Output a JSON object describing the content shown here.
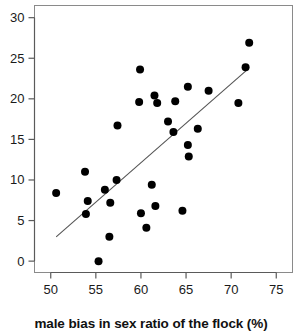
{
  "chart_data": {
    "type": "scatter",
    "title": "",
    "xlabel": "male bias in sex ratio of the flock (%)",
    "ylabel": "",
    "xlim": [
      48.2,
      76.8
    ],
    "ylim": [
      -1.4,
      31.5
    ],
    "xticks": [
      50,
      55,
      60,
      65,
      70,
      75
    ],
    "yticks": [
      0,
      5,
      10,
      15,
      20,
      25,
      30
    ],
    "xtick_labels": [
      "50",
      "55",
      "60",
      "65",
      "70",
      "75"
    ],
    "ytick_labels": [
      "0",
      "5",
      "10",
      "15",
      "20",
      "25",
      "30"
    ],
    "grid": false,
    "legend": null,
    "marker": "filled-circle",
    "marker_color": "#000000",
    "marker_size": 5.6,
    "points": [
      {
        "x": 50.6,
        "y": 8.4
      },
      {
        "x": 53.8,
        "y": 11.0
      },
      {
        "x": 53.9,
        "y": 5.8
      },
      {
        "x": 54.1,
        "y": 7.4
      },
      {
        "x": 55.3,
        "y": 0.0
      },
      {
        "x": 56.0,
        "y": 8.8
      },
      {
        "x": 56.5,
        "y": 3.0
      },
      {
        "x": 56.6,
        "y": 7.2
      },
      {
        "x": 57.3,
        "y": 10.0
      },
      {
        "x": 57.4,
        "y": 16.7
      },
      {
        "x": 59.8,
        "y": 19.6
      },
      {
        "x": 59.9,
        "y": 23.6
      },
      {
        "x": 60.0,
        "y": 5.9
      },
      {
        "x": 60.6,
        "y": 4.1
      },
      {
        "x": 61.2,
        "y": 9.4
      },
      {
        "x": 61.5,
        "y": 20.4
      },
      {
        "x": 61.6,
        "y": 6.8
      },
      {
        "x": 61.8,
        "y": 19.5
      },
      {
        "x": 63.0,
        "y": 17.2
      },
      {
        "x": 63.6,
        "y": 15.9
      },
      {
        "x": 63.8,
        "y": 19.7
      },
      {
        "x": 64.6,
        "y": 6.2
      },
      {
        "x": 65.2,
        "y": 21.5
      },
      {
        "x": 65.2,
        "y": 14.3
      },
      {
        "x": 65.3,
        "y": 12.9
      },
      {
        "x": 66.3,
        "y": 16.3
      },
      {
        "x": 67.5,
        "y": 21.0
      },
      {
        "x": 70.8,
        "y": 19.5
      },
      {
        "x": 71.6,
        "y": 23.9
      },
      {
        "x": 72.0,
        "y": 26.9
      }
    ],
    "fit_line": {
      "type": "linear-regression",
      "color": "#555555",
      "x_start": 50.6,
      "y_start": 3.0,
      "x_end": 71.7,
      "y_end": 23.5
    }
  }
}
